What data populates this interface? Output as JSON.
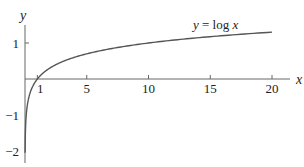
{
  "chart_data": {
    "type": "line",
    "title": "",
    "annotation": "y = log x",
    "annotation_parts": {
      "y": "y",
      "eq": " = log ",
      "x": "x"
    },
    "xlabel": "x",
    "ylabel": "y",
    "xlim": [
      0,
      21.5
    ],
    "ylim": [
      -2.05,
      1.6
    ],
    "x_ticks": [
      1,
      5,
      10,
      15,
      20
    ],
    "x_tick_labels": [
      "1",
      "5",
      "10",
      "15",
      "20"
    ],
    "y_ticks": [
      1,
      -1,
      -2
    ],
    "y_tick_labels": [
      "1",
      "−1",
      "−2"
    ],
    "grid": false,
    "series": [
      {
        "name": "y = log x",
        "function": "log10(x)",
        "x": [
          0.009,
          0.02,
          0.05,
          0.1,
          0.2,
          0.5,
          1,
          2,
          3,
          5,
          7,
          10,
          13,
          15,
          18,
          20
        ],
        "values": [
          -2.05,
          -1.7,
          -1.3,
          -1.0,
          -0.7,
          -0.3,
          0,
          0.301,
          0.477,
          0.699,
          0.845,
          1.0,
          1.114,
          1.176,
          1.255,
          1.301
        ],
        "color": "#555555"
      }
    ]
  },
  "colors": {
    "axis": "#666666",
    "curve": "#555555",
    "text": "#222222"
  }
}
